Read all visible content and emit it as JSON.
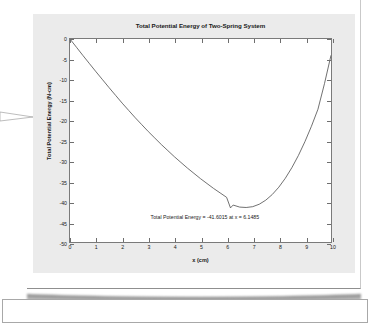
{
  "document": {
    "name": "report-page"
  },
  "lower_panel": {
    "name": "lower-content-panel"
  },
  "chart_data": {
    "type": "line",
    "title": "Total Potential Energy of Two-Spring System",
    "xlabel": "x (cm)",
    "ylabel": "Total Potential Energy (N-cm)",
    "xlim": [
      0,
      10
    ],
    "ylim": [
      -50,
      0
    ],
    "grid": false,
    "legend": null,
    "xticks": [
      0,
      1,
      2,
      3,
      4,
      5,
      6,
      7,
      8,
      9,
      10
    ],
    "xtick_labels": [
      "0",
      "1",
      "2",
      "3",
      "4",
      "5",
      "6",
      "7",
      "8",
      "9",
      "10"
    ],
    "yticks": [
      0,
      -5,
      -10,
      -15,
      -20,
      -25,
      -30,
      -35,
      -40,
      -45,
      -50
    ],
    "ytick_labels": [
      "0",
      "-5",
      "-10",
      "-15",
      "-20",
      "-25",
      "-30",
      "-35",
      "-40",
      "-45",
      "-50"
    ],
    "annotation": "Total Potential Energy = -41.6015 at x = 6.1485",
    "minimum": {
      "x": 6.1485,
      "y": -41.6015
    },
    "line_color": "#4d4d4d",
    "series": [
      {
        "name": "Total Potential Energy",
        "x": [
          0,
          0.25,
          0.5,
          0.75,
          1,
          1.25,
          1.5,
          1.75,
          2,
          2.25,
          2.5,
          2.75,
          3,
          3.25,
          3.5,
          3.75,
          4,
          4.25,
          4.5,
          4.75,
          5,
          5.25,
          5.5,
          5.75,
          6,
          6.1485,
          6.25,
          6.5,
          6.75,
          7,
          7.25,
          7.5,
          7.75,
          8,
          8.25,
          8.5,
          8.75,
          9,
          9.25,
          9.5,
          9.75,
          10
        ],
        "y": [
          0,
          -2.05,
          -4.1,
          -6.1,
          -8.1,
          -10.05,
          -12.0,
          -13.9,
          -15.8,
          -17.6,
          -19.4,
          -21.1,
          -22.8,
          -24.4,
          -26.0,
          -27.5,
          -29.0,
          -30.4,
          -31.8,
          -33.1,
          -34.4,
          -35.6,
          -36.8,
          -37.9,
          -39.0,
          -41.6015,
          -40.9,
          -41.4,
          -41.5,
          -41.3,
          -40.7,
          -39.7,
          -38.3,
          -36.5,
          -34.3,
          -31.7,
          -28.7,
          -25.3,
          -21.5,
          -17.3,
          -11.0,
          -4.0
        ]
      }
    ]
  }
}
